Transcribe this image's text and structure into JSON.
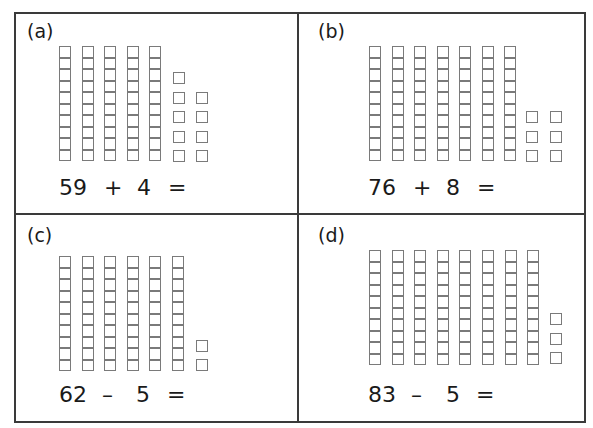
{
  "panels": [
    {
      "id": "a",
      "label": "(a)",
      "operand1": "59",
      "operator": "+",
      "operand2": "4",
      "equals": "=",
      "tens_rods": 5,
      "unit_columns": [
        5,
        4
      ],
      "total_units": 9,
      "origin": {
        "x": 14,
        "y": 12
      },
      "rod_top": 46,
      "rods_bottom": 162
    },
    {
      "id": "b",
      "label": "(b)",
      "operand1": "76",
      "operator": "+",
      "operand2": "8",
      "equals": "=",
      "tens_rods": 7,
      "unit_columns": [
        3,
        3
      ],
      "total_units": 6,
      "origin": {
        "x": 298,
        "y": 12
      },
      "rod_top": 46,
      "rods_bottom": 162
    },
    {
      "id": "c",
      "label": "(c)",
      "operand1": "62",
      "operator": "–",
      "operand2": "5",
      "equals": "=",
      "tens_rods": 6,
      "unit_columns": [
        2
      ],
      "total_units": 2,
      "origin": {
        "x": 14,
        "y": 214
      },
      "rod_top": 256,
      "rods_bottom": 371
    },
    {
      "id": "d",
      "label": "(d)",
      "operand1": "83",
      "operator": "–",
      "operand2": "5",
      "equals": "=",
      "tens_rods": 8,
      "unit_columns": [
        3
      ],
      "total_units": 3,
      "origin": {
        "x": 298,
        "y": 214
      },
      "rod_top": 250,
      "rods_bottom": 364
    }
  ],
  "style": {
    "line_color": "#3a3a3a",
    "block_outline_color": "#7a7a7a",
    "text_color": "#1a1a1a"
  }
}
